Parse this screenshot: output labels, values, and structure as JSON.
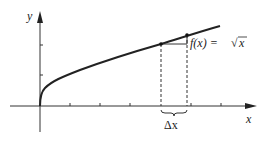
{
  "diagram": {
    "type": "function-graph",
    "function_label": "f(x) = √x",
    "function_label_parts": {
      "lhs": "f(x) = ",
      "radical": "√",
      "radicand": "x"
    },
    "x_axis_label": "x",
    "y_axis_label": "y",
    "delta_label": "Δx",
    "colors": {
      "ink": "#222222",
      "background": "#ffffff"
    },
    "points": [
      {
        "name": "point-x",
        "px": 161,
        "py": 44
      },
      {
        "name": "point-x-plus-dx",
        "px": 187,
        "py": 35
      }
    ]
  }
}
